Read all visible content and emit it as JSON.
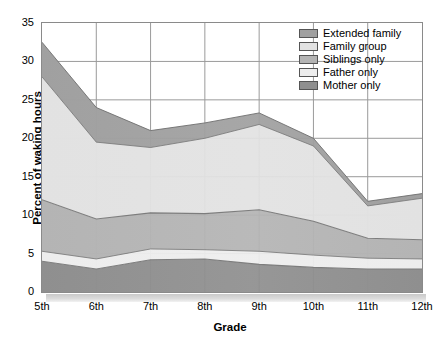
{
  "chart_data": {
    "type": "area",
    "stacked": true,
    "title": "",
    "xlabel": "Grade",
    "ylabel": "Percent of waking hours",
    "categories": [
      "5th",
      "6th",
      "7th",
      "8th",
      "9th",
      "10th",
      "11th",
      "12th"
    ],
    "ylim": [
      0,
      35
    ],
    "yticks": [
      0,
      5,
      10,
      15,
      20,
      25,
      30,
      35
    ],
    "grid": true,
    "legend_position": "top-right",
    "series": [
      {
        "name": "Mother only",
        "color": "#8f8f8f",
        "values": [
          4.0,
          3.0,
          4.2,
          4.3,
          3.6,
          3.2,
          3.0,
          3.0
        ]
      },
      {
        "name": "Father only",
        "color": "#ededed",
        "values": [
          1.3,
          1.3,
          1.4,
          1.2,
          1.7,
          1.6,
          1.4,
          1.3
        ]
      },
      {
        "name": "Siblings only",
        "color": "#b4b4b4",
        "values": [
          6.7,
          5.2,
          4.7,
          4.7,
          5.4,
          4.4,
          2.6,
          2.5
        ]
      },
      {
        "name": "Family group",
        "color": "#e2e2e2",
        "values": [
          16.0,
          10.0,
          8.5,
          9.8,
          11.1,
          9.8,
          4.2,
          5.4
        ]
      },
      {
        "name": "Extended family",
        "color": "#a0a0a0",
        "values": [
          4.5,
          4.5,
          2.2,
          2.0,
          1.5,
          1.0,
          0.6,
          0.6
        ]
      }
    ],
    "cumulative_totals": [
      32.5,
      24.0,
      21.0,
      22.0,
      23.3,
      20.0,
      11.8,
      12.8
    ]
  },
  "legend": {
    "items": [
      {
        "label": "Extended family"
      },
      {
        "label": "Family group"
      },
      {
        "label": "Siblings only"
      },
      {
        "label": "Father only"
      },
      {
        "label": "Mother only"
      }
    ]
  },
  "axes": {
    "y_title": "Percent of waking hours",
    "x_title": "Grade",
    "y_ticks": [
      "35",
      "30",
      "25",
      "20",
      "15",
      "10",
      "5",
      "0"
    ],
    "x_ticks": [
      "5th",
      "6th",
      "7th",
      "8th",
      "9th",
      "10th",
      "11th",
      "12th"
    ]
  }
}
